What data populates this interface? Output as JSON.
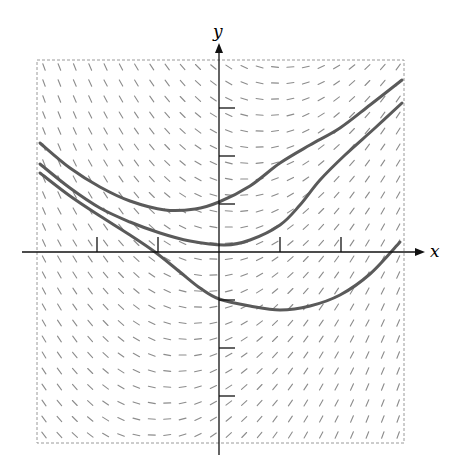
{
  "diagram": {
    "type": "slope_field_with_solution_curves",
    "axes": {
      "x_label": "x",
      "y_label": "y",
      "origin_px": [
        219,
        252
      ],
      "x_unit_px": 61,
      "y_unit_px": 48,
      "x_axis_px": [
        22,
        425
      ],
      "y_axis_px": [
        43,
        455
      ],
      "x_ticks": [
        -2,
        -1,
        1,
        2
      ],
      "y_ticks": [
        -3,
        -2,
        -1,
        1,
        2,
        3
      ],
      "axis_color": "#111111"
    },
    "frame": {
      "left": 37,
      "top": 60,
      "right": 404,
      "bottom": 443,
      "color": "#9a9a9a",
      "style": "dashed"
    },
    "slope_field": {
      "cols": 24,
      "rows": 24,
      "x_start_px": 44,
      "x_step_px": 15.4,
      "y_start_px": 67,
      "y_step_px": 16,
      "segment_length_px": 7,
      "color": "#8c8c8c",
      "slope_formula": "0.9*X - 0.25*Y",
      "coef_x": 0.9,
      "coef_y": -0.25
    },
    "solution_curves": [
      {
        "name": "upper-curve",
        "color": "#5a5a5a",
        "points_px": [
          [
            40,
            143
          ],
          [
            70,
            168
          ],
          [
            100,
            187
          ],
          [
            130,
            201
          ],
          [
            165,
            210
          ],
          [
            195,
            209
          ],
          [
            219,
            202
          ],
          [
            250,
            186
          ],
          [
            280,
            163
          ],
          [
            310,
            145
          ],
          [
            340,
            128
          ],
          [
            370,
            105
          ],
          [
            402,
            80
          ]
        ]
      },
      {
        "name": "middle-curve",
        "color": "#5a5a5a",
        "points_px": [
          [
            40,
            164
          ],
          [
            70,
            188
          ],
          [
            100,
            208
          ],
          [
            130,
            222
          ],
          [
            160,
            233
          ],
          [
            190,
            241
          ],
          [
            225,
            245
          ],
          [
            250,
            240
          ],
          [
            280,
            225
          ],
          [
            300,
            205
          ],
          [
            320,
            180
          ],
          [
            345,
            155
          ],
          [
            375,
            128
          ],
          [
            402,
            103
          ]
        ]
      },
      {
        "name": "lower-curve",
        "color": "#5a5a5a",
        "points_px": [
          [
            40,
            173
          ],
          [
            70,
            196
          ],
          [
            100,
            216
          ],
          [
            130,
            235
          ],
          [
            155,
            252
          ],
          [
            180,
            272
          ],
          [
            200,
            288
          ],
          [
            219,
            299
          ],
          [
            250,
            306
          ],
          [
            280,
            310
          ],
          [
            310,
            306
          ],
          [
            340,
            295
          ],
          [
            370,
            274
          ],
          [
            400,
            242
          ]
        ]
      }
    ]
  }
}
